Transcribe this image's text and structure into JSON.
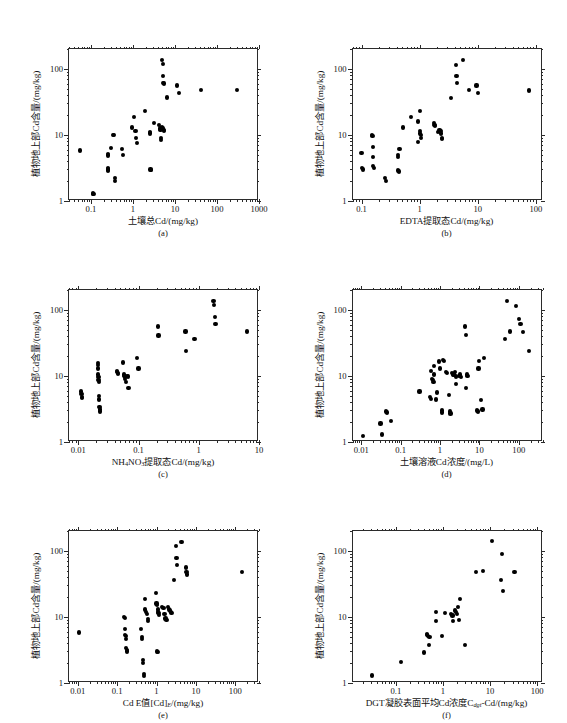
{
  "figure": {
    "shared_ylabel": "植物地上部Cd含量/(mg/kg)",
    "y_ticklabels": [
      "1",
      "10",
      "100"
    ],
    "point_color": "#000000",
    "axis_color": "#2b2b2b"
  },
  "chart_data": [
    {
      "id": "a",
      "tag": "(a)",
      "type": "scatter",
      "title": "",
      "xlabel": "土壤总Cd/(mg/kg)",
      "ylabel": "植物地上部Cd含量/(mg/kg)",
      "xscale": "log",
      "yscale": "log",
      "xlim": [
        0.03,
        1000
      ],
      "ylim": [
        1,
        200
      ],
      "xticks": [
        0.1,
        1,
        10,
        100,
        1000
      ],
      "xticklabels": [
        "0.1",
        "1",
        "10",
        "100",
        "1000"
      ],
      "yticks": [
        1,
        10,
        100
      ],
      "yticklabels": [
        "1",
        "10",
        "100"
      ],
      "grid": false,
      "legend": null,
      "points": [
        [
          0.055,
          5.8
        ],
        [
          0.112,
          1.3
        ],
        [
          0.115,
          1.28
        ],
        [
          0.25,
          5.2
        ],
        [
          0.25,
          4.9
        ],
        [
          0.25,
          3.2
        ],
        [
          0.25,
          3.0
        ],
        [
          0.25,
          2.9
        ],
        [
          0.3,
          6.3
        ],
        [
          0.33,
          10.0
        ],
        [
          0.36,
          10.0
        ],
        [
          0.37,
          2.2
        ],
        [
          0.37,
          2.0
        ],
        [
          0.55,
          6.2
        ],
        [
          0.58,
          5.0
        ],
        [
          0.95,
          13.0
        ],
        [
          1.05,
          18.5
        ],
        [
          1.15,
          11.5
        ],
        [
          1.2,
          9.0
        ],
        [
          1.25,
          7.5
        ],
        [
          1.9,
          23.0
        ],
        [
          2.5,
          11.0
        ],
        [
          2.55,
          10.5
        ],
        [
          2.6,
          3.0
        ],
        [
          2.65,
          2.95
        ],
        [
          3.2,
          15.0
        ],
        [
          4.2,
          14.0
        ],
        [
          4.4,
          12.5
        ],
        [
          4.5,
          12.0
        ],
        [
          4.6,
          9.0
        ],
        [
          4.7,
          8.5
        ],
        [
          5.0,
          13.0
        ],
        [
          5.2,
          12.5
        ],
        [
          5.4,
          12.0
        ],
        [
          5.5,
          11.5
        ],
        [
          5.0,
          135.0
        ],
        [
          5.1,
          120.0
        ],
        [
          5.2,
          78.0
        ],
        [
          5.3,
          62.0
        ],
        [
          5.4,
          60.0
        ],
        [
          6.5,
          37.0
        ],
        [
          11.0,
          56.0
        ],
        [
          12.5,
          43.0
        ],
        [
          42.0,
          48.0
        ],
        [
          300.0,
          48.0
        ]
      ]
    },
    {
      "id": "b",
      "tag": "(b)",
      "type": "scatter",
      "title": "",
      "xlabel": "EDTA提取态Cd/(mg/kg)",
      "ylabel": "植物地上部Cd含量/(mg/kg)",
      "xscale": "log",
      "yscale": "log",
      "xlim": [
        0.07,
        130
      ],
      "ylim": [
        1,
        200
      ],
      "xticks": [
        0.1,
        1,
        10,
        100
      ],
      "xticklabels": [
        "0.1",
        "1",
        "10",
        "100"
      ],
      "yticks": [
        1,
        10,
        100
      ],
      "yticklabels": [
        "1",
        "10",
        "100"
      ],
      "grid": false,
      "legend": null,
      "points": [
        [
          0.1,
          5.4
        ],
        [
          0.102,
          3.2
        ],
        [
          0.105,
          3.0
        ],
        [
          0.15,
          10.0
        ],
        [
          0.155,
          9.6
        ],
        [
          0.16,
          6.5
        ],
        [
          0.16,
          4.6
        ],
        [
          0.16,
          3.4
        ],
        [
          0.162,
          3.2
        ],
        [
          0.25,
          2.2
        ],
        [
          0.26,
          2.0
        ],
        [
          0.42,
          5.0
        ],
        [
          0.43,
          4.6
        ],
        [
          0.43,
          2.9
        ],
        [
          0.44,
          2.8
        ],
        [
          0.45,
          6.2
        ],
        [
          0.52,
          13.0
        ],
        [
          0.72,
          18.5
        ],
        [
          0.95,
          16.0
        ],
        [
          1.0,
          23.0
        ],
        [
          1.0,
          11.5
        ],
        [
          1.02,
          10.5
        ],
        [
          1.05,
          10.0
        ],
        [
          1.05,
          9.0
        ],
        [
          0.95,
          7.8
        ],
        [
          1.75,
          15.0
        ],
        [
          1.8,
          14.0
        ],
        [
          1.85,
          13.5
        ],
        [
          2.1,
          11.0
        ],
        [
          2.2,
          12.0
        ],
        [
          2.3,
          11.5
        ],
        [
          2.35,
          10.5
        ],
        [
          2.4,
          9.0
        ],
        [
          2.45,
          8.6
        ],
        [
          3.5,
          36.0
        ],
        [
          4.2,
          115.0
        ],
        [
          4.3,
          78.0
        ],
        [
          4.4,
          62.0
        ],
        [
          5.5,
          135.0
        ],
        [
          7.0,
          48.0
        ],
        [
          9.5,
          56.0
        ],
        [
          10.0,
          43.0
        ],
        [
          75.0,
          47.0
        ]
      ]
    },
    {
      "id": "c",
      "tag": "(c)",
      "type": "scatter",
      "title": "",
      "xlabel_html": "NH<sub>4</sub>NO<sub>3</sub>提取态Cd/(mg/kg)",
      "xlabel": "NH4NO3提取态Cd/(mg/kg)",
      "ylabel": "植物地上部Cd含量/(mg/kg)",
      "xscale": "log",
      "yscale": "log",
      "xlim": [
        0.007,
        10
      ],
      "ylim": [
        1,
        200
      ],
      "xticks": [
        0.01,
        0.1,
        1,
        10
      ],
      "xticklabels": [
        "0.01",
        "0.1",
        "1",
        "10"
      ],
      "yticks": [
        1,
        10,
        100
      ],
      "yticklabels": [
        "1",
        "10",
        "100"
      ],
      "grid": false,
      "legend": null,
      "points": [
        [
          0.0112,
          5.8
        ],
        [
          0.0113,
          5.4
        ],
        [
          0.0115,
          4.8
        ],
        [
          0.0116,
          4.6
        ],
        [
          0.021,
          15.5
        ],
        [
          0.0212,
          14.5
        ],
        [
          0.0214,
          13.0
        ],
        [
          0.0215,
          10.5
        ],
        [
          0.0216,
          9.6
        ],
        [
          0.0217,
          8.8
        ],
        [
          0.0218,
          8.2
        ],
        [
          0.022,
          5.0
        ],
        [
          0.0222,
          4.4
        ],
        [
          0.0224,
          3.4
        ],
        [
          0.0226,
          3.1
        ],
        [
          0.0228,
          2.9
        ],
        [
          0.044,
          12.0
        ],
        [
          0.0445,
          11.5
        ],
        [
          0.045,
          11.0
        ],
        [
          0.046,
          10.8
        ],
        [
          0.055,
          16.0
        ],
        [
          0.057,
          10.5
        ],
        [
          0.058,
          10.0
        ],
        [
          0.059,
          9.6
        ],
        [
          0.06,
          9.0
        ],
        [
          0.062,
          8.0
        ],
        [
          0.064,
          10.0
        ],
        [
          0.066,
          9.8
        ],
        [
          0.068,
          6.6
        ],
        [
          0.095,
          18.5
        ],
        [
          0.1,
          13.0
        ],
        [
          0.21,
          56.0
        ],
        [
          0.215,
          41.0
        ],
        [
          0.6,
          47.0
        ],
        [
          0.61,
          24.0
        ],
        [
          0.85,
          36.0
        ],
        [
          1.75,
          135.0
        ],
        [
          1.8,
          120.0
        ],
        [
          1.85,
          78.0
        ],
        [
          1.9,
          62.0
        ],
        [
          6.3,
          47.0
        ]
      ]
    },
    {
      "id": "d",
      "tag": "(d)",
      "type": "scatter",
      "title": "",
      "xlabel": "土壤溶液Cd浓度/(mg/L)",
      "ylabel": "植物地上部Cd含量/(mg/kg)",
      "xscale": "log",
      "yscale": "log",
      "xlim": [
        0.006,
        400
      ],
      "ylim": [
        1,
        200
      ],
      "xticks": [
        0.01,
        0.1,
        1,
        10,
        100
      ],
      "xticklabels": [
        "0.01",
        "0.1",
        "1",
        "10",
        "100"
      ],
      "yticks": [
        1,
        10,
        100
      ],
      "yticklabels": [
        "1",
        "10",
        "100"
      ],
      "grid": false,
      "legend": null,
      "points": [
        [
          0.011,
          1.25
        ],
        [
          0.031,
          1.9
        ],
        [
          0.033,
          1.3
        ],
        [
          0.043,
          2.9
        ],
        [
          0.045,
          2.8
        ],
        [
          0.058,
          2.1
        ],
        [
          0.3,
          5.8
        ],
        [
          0.55,
          4.8
        ],
        [
          0.58,
          4.5
        ],
        [
          0.6,
          12.0
        ],
        [
          0.62,
          9.0
        ],
        [
          0.65,
          8.6
        ],
        [
          0.68,
          8.2
        ],
        [
          0.7,
          14.0
        ],
        [
          0.72,
          10.5
        ],
        [
          0.8,
          4.4
        ],
        [
          0.85,
          5.6
        ],
        [
          0.95,
          16.5
        ],
        [
          1.0,
          13.0
        ],
        [
          1.1,
          3.0
        ],
        [
          1.15,
          2.8
        ],
        [
          1.2,
          17.5
        ],
        [
          1.25,
          17.0
        ],
        [
          1.4,
          11.5
        ],
        [
          1.5,
          11.0
        ],
        [
          1.7,
          5.2
        ],
        [
          1.8,
          2.9
        ],
        [
          1.85,
          2.7
        ],
        [
          2.0,
          11.0
        ],
        [
          2.1,
          10.5
        ],
        [
          2.2,
          10.8
        ],
        [
          2.3,
          10.2
        ],
        [
          2.4,
          11.5
        ],
        [
          2.5,
          9.8
        ],
        [
          2.6,
          7.5
        ],
        [
          3.0,
          10.0
        ],
        [
          3.2,
          10.5
        ],
        [
          3.4,
          9.6
        ],
        [
          4.3,
          56.0
        ],
        [
          4.5,
          42.0
        ],
        [
          4.6,
          6.5
        ],
        [
          4.8,
          10.5
        ],
        [
          5.0,
          10.0
        ],
        [
          8.5,
          3.0
        ],
        [
          9.0,
          2.9
        ],
        [
          9.5,
          13.0
        ],
        [
          10.0,
          17.0
        ],
        [
          11.0,
          4.3
        ],
        [
          12.0,
          3.1
        ],
        [
          13.0,
          18.5
        ],
        [
          45.0,
          36.0
        ],
        [
          50.0,
          135.0
        ],
        [
          60.0,
          47.0
        ],
        [
          85.0,
          115.0
        ],
        [
          100.0,
          72.0
        ],
        [
          110.0,
          62.0
        ],
        [
          130.0,
          46.0
        ],
        [
          180.0,
          24.0
        ]
      ]
    },
    {
      "id": "e",
      "tag": "(e)",
      "type": "scatter",
      "title": "",
      "xlabel_html": "Cd E值[Cd]<sub class=\"it\">E</sub>/(mg/kg)",
      "xlabel": "Cd E值[Cd]E/(mg/kg)",
      "ylabel": "植物地上部Cd含量/(mg/kg)",
      "xscale": "log",
      "yscale": "log",
      "xlim": [
        0.006,
        400
      ],
      "ylim": [
        1,
        200
      ],
      "xticks": [
        0.01,
        0.1,
        1,
        10,
        100
      ],
      "xticklabels": [
        "0.01",
        "0.1",
        "1",
        "10",
        "100"
      ],
      "yticks": [
        1,
        10,
        100
      ],
      "yticklabels": [
        "1",
        "10",
        "100"
      ],
      "grid": false,
      "legend": null,
      "points": [
        [
          0.011,
          5.8
        ],
        [
          0.15,
          10.0
        ],
        [
          0.155,
          9.6
        ],
        [
          0.16,
          6.5
        ],
        [
          0.162,
          5.4
        ],
        [
          0.165,
          5.2
        ],
        [
          0.17,
          4.6
        ],
        [
          0.172,
          3.4
        ],
        [
          0.175,
          3.2
        ],
        [
          0.178,
          3.0
        ],
        [
          0.4,
          6.5
        ],
        [
          0.42,
          5.0
        ],
        [
          0.43,
          4.6
        ],
        [
          0.45,
          2.2
        ],
        [
          0.46,
          2.0
        ],
        [
          0.47,
          1.35
        ],
        [
          0.48,
          1.28
        ],
        [
          0.5,
          18.5
        ],
        [
          0.52,
          13.0
        ],
        [
          0.54,
          12.0
        ],
        [
          0.58,
          11.0
        ],
        [
          0.6,
          8.8
        ],
        [
          0.62,
          9.2
        ],
        [
          0.95,
          23.0
        ],
        [
          1.0,
          16.0
        ],
        [
          1.05,
          15.0
        ],
        [
          1.08,
          13.0
        ],
        [
          1.1,
          12.0
        ],
        [
          1.12,
          11.5
        ],
        [
          1.15,
          10.8
        ],
        [
          1.05,
          3.0
        ],
        [
          1.1,
          2.95
        ],
        [
          1.4,
          14.0
        ],
        [
          1.5,
          13.5
        ],
        [
          1.6,
          11.0
        ],
        [
          1.7,
          9.5
        ],
        [
          1.8,
          9.0
        ],
        [
          2.0,
          14.0
        ],
        [
          2.1,
          13.0
        ],
        [
          2.2,
          12.5
        ],
        [
          2.3,
          12.0
        ],
        [
          2.4,
          11.5
        ],
        [
          2.8,
          36.0
        ],
        [
          3.1,
          120.0
        ],
        [
          3.2,
          78.0
        ],
        [
          3.3,
          62.0
        ],
        [
          4.3,
          135.0
        ],
        [
          5.5,
          56.0
        ],
        [
          5.8,
          48.0
        ],
        [
          6.0,
          44.0
        ],
        [
          150.0,
          48.0
        ]
      ]
    },
    {
      "id": "f",
      "tag": "(f)",
      "type": "scatter",
      "title": "",
      "xlabel_html": "DGT凝胶表面平均Cd浓度C<sub class=\"it\">dgt</sub>-Cd/(mg/kg)",
      "xlabel": "DGT凝胶表面平均Cd浓度Cdgt-Cd/(mg/kg)",
      "ylabel": "植物地上部Cd含量/(mg/kg)",
      "xscale": "log",
      "yscale": "log",
      "xlim": [
        0.012,
        130
      ],
      "ylim": [
        1,
        200
      ],
      "xticks": [
        0.01,
        0.1,
        1,
        10,
        100
      ],
      "xticklabels": [
        "0.01",
        "0.1",
        "1",
        "10",
        "100"
      ],
      "yticks": [
        1,
        10,
        100
      ],
      "yticklabels": [
        "1",
        "10",
        "100"
      ],
      "grid": false,
      "legend": null,
      "points": [
        [
          0.031,
          1.3
        ],
        [
          0.13,
          2.1
        ],
        [
          0.4,
          2.9
        ],
        [
          0.45,
          5.5
        ],
        [
          0.46,
          5.4
        ],
        [
          0.48,
          5.2
        ],
        [
          0.5,
          3.8
        ],
        [
          0.52,
          5.0
        ],
        [
          0.7,
          12.0
        ],
        [
          0.72,
          8.6
        ],
        [
          0.95,
          5.2
        ],
        [
          1.1,
          11.5
        ],
        [
          1.5,
          11.0
        ],
        [
          1.6,
          10.5
        ],
        [
          1.65,
          8.8
        ],
        [
          1.8,
          12.5
        ],
        [
          1.9,
          12.0
        ],
        [
          2.0,
          11.0
        ],
        [
          2.1,
          14.0
        ],
        [
          2.2,
          9.0
        ],
        [
          2.3,
          18.5
        ],
        [
          2.9,
          3.8
        ],
        [
          5.0,
          48.0
        ],
        [
          7.0,
          50.0
        ],
        [
          11.0,
          140.0
        ],
        [
          17.0,
          36.0
        ],
        [
          18.0,
          90.0
        ],
        [
          19.0,
          25.0
        ],
        [
          33.0,
          48.0
        ]
      ]
    }
  ]
}
